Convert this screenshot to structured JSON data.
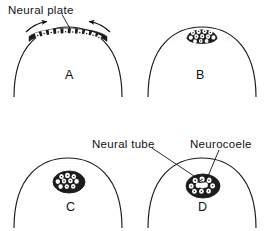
{
  "figure": {
    "background_color": "#ffffff",
    "ink_color": "#111111",
    "panel_count": 4
  },
  "labels": {
    "neural_plate": "Neural plate",
    "neural_tube": "Neural tube",
    "neurocoele": "Neurocoele"
  },
  "panels": [
    {
      "letter": "A",
      "stage": "neural plate",
      "description": "Flat thickened band of neural plate cells across the dorsal surface with converging arrows",
      "arrows": 2
    },
    {
      "letter": "B",
      "stage": "neural fold",
      "description": "Neural plate folded into a raised mound of cells bulging above the surface",
      "arrows": 0
    },
    {
      "letter": "C",
      "stage": "neural tube closing",
      "description": "Cell mass sunk beneath the surface forming a rounded tube with stippled remnant above",
      "arrows": 0
    },
    {
      "letter": "D",
      "stage": "neural tube complete",
      "description": "Closed neural tube with central cavity, the neurocoele",
      "arrows": 0
    }
  ],
  "callouts": [
    {
      "label": "Neural plate",
      "points_to_panel": "A"
    },
    {
      "label": "Neural tube",
      "points_to_panel": "D"
    },
    {
      "label": "Neurocoele",
      "points_to_panel": "D"
    }
  ]
}
